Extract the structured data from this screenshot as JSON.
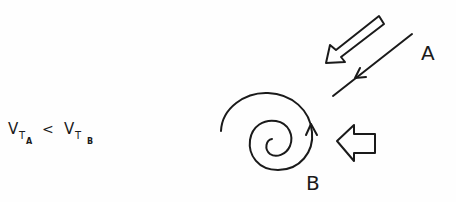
{
  "diagram": {
    "relation": {
      "lhs": {
        "symbol": "V",
        "sub": "T",
        "subsub": "A"
      },
      "operator": "<",
      "rhs": {
        "symbol": "V",
        "sub": "T",
        "subsub": "B"
      }
    },
    "labels": {
      "a": "A",
      "b": "B"
    },
    "elements": [
      {
        "id": "A",
        "kind": "straight-line trajectory with direction arrow",
        "incoming": "hollow block arrow from upper right"
      },
      {
        "id": "B",
        "kind": "spiral trajectory with direction arrow",
        "incoming": "hollow block arrow from right"
      }
    ],
    "colors": {
      "ink": "#1a1a1a",
      "background": "#fefefe"
    }
  }
}
